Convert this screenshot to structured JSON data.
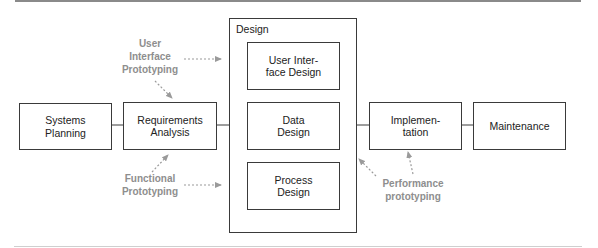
{
  "diagram": {
    "type": "process-flow",
    "stages": [
      {
        "id": "systems-planning",
        "label": "Systems\nPlanning"
      },
      {
        "id": "requirements-analysis",
        "label": "Requirements\nAnalysis"
      },
      {
        "id": "design",
        "label": "Design",
        "children": [
          {
            "id": "ui-design",
            "label": "User Inter-\nface Design"
          },
          {
            "id": "data-design",
            "label": "Data\nDesign"
          },
          {
            "id": "process-design",
            "label": "Process\nDesign"
          }
        ]
      },
      {
        "id": "implementation",
        "label": "Implemen-\ntation"
      },
      {
        "id": "maintenance",
        "label": "Maintenance"
      }
    ],
    "prototyping": [
      {
        "id": "ui-prototyping",
        "label": "User\nInterface\nPrototyping",
        "targets": [
          "requirements-analysis",
          "ui-design"
        ]
      },
      {
        "id": "functional-prototyping",
        "label": "Functional\nPrototyping",
        "targets": [
          "requirements-analysis",
          "process-design"
        ]
      },
      {
        "id": "performance-prototyping",
        "label": "Performance\nprototyping",
        "targets": [
          "design",
          "implementation"
        ]
      }
    ],
    "colors": {
      "box_border": "#3a3a3a",
      "text": "#222222",
      "prototype_text": "#8e8e8e",
      "arrow": "#9a9a9a"
    }
  }
}
